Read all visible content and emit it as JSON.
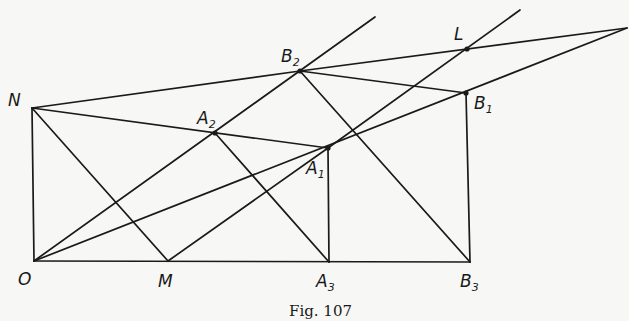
{
  "figure": {
    "caption": "Fig. 107",
    "stroke_color": "#1a1a1a",
    "background": "#f7f7f5"
  },
  "points": {
    "O": {
      "name": "O",
      "sub": "",
      "x": 34,
      "y": 261,
      "lx": 18,
      "ly": 285
    },
    "M": {
      "name": "M",
      "sub": "",
      "x": 168,
      "y": 261,
      "lx": 158,
      "ly": 287
    },
    "A3": {
      "name": "A",
      "sub": "3",
      "x": 329,
      "y": 262,
      "lx": 316,
      "ly": 287
    },
    "B3": {
      "name": "B",
      "sub": "3",
      "x": 470,
      "y": 262,
      "lx": 460,
      "ly": 287
    },
    "N": {
      "name": "N",
      "sub": "",
      "x": 32,
      "y": 108,
      "lx": 8,
      "ly": 106
    },
    "A2": {
      "name": "A",
      "sub": "2",
      "x": 215,
      "y": 133,
      "lx": 197,
      "ly": 124
    },
    "A1": {
      "name": "A",
      "sub": "1",
      "x": 328,
      "y": 148,
      "lx": 306,
      "ly": 174
    },
    "B2": {
      "name": "B",
      "sub": "2",
      "x": 300,
      "y": 71,
      "lx": 281,
      "ly": 62
    },
    "B1": {
      "name": "B",
      "sub": "1",
      "x": 466,
      "y": 93,
      "lx": 474,
      "ly": 109
    },
    "L": {
      "name": "L",
      "sub": "",
      "x": 467,
      "y": 49,
      "lx": 454,
      "ly": 40
    },
    "P": {
      "name": "",
      "sub": "",
      "x": 627,
      "y": 28,
      "lx": 0,
      "ly": 0
    }
  },
  "segments": [
    {
      "from": "O",
      "to": "N"
    },
    {
      "from": "O",
      "to": "B3"
    },
    {
      "from": "N",
      "to": "B2"
    },
    {
      "from": "N",
      "to": "A1"
    },
    {
      "from": "N",
      "to": "M"
    },
    {
      "from": "O",
      "to": "P"
    },
    {
      "from": "M",
      "to": "A1"
    },
    {
      "from": "A2",
      "to": "A3"
    },
    {
      "from": "B2",
      "to": "B3"
    },
    {
      "from": "A1",
      "to": "A3"
    },
    {
      "from": "B1",
      "to": "B3"
    },
    {
      "from": "B2",
      "to": "B1"
    },
    {
      "from": "B2",
      "to": "P"
    }
  ],
  "rays": [
    {
      "from": "O",
      "x2": 375,
      "y2": 17,
      "note": "O through A2 and B2"
    },
    {
      "from": "A1",
      "x2": 520,
      "y2": 10,
      "note": "M through A1 and L"
    }
  ],
  "labels": [
    "O",
    "M",
    "A3",
    "B3",
    "N",
    "A2",
    "A1",
    "B2",
    "B1",
    "L"
  ]
}
